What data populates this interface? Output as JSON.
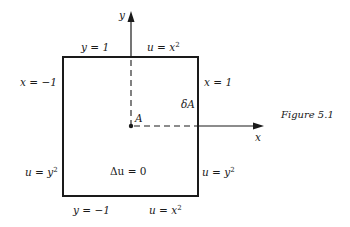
{
  "figure": {
    "caption": "Figure  5.1",
    "axes": {
      "x_label": "x",
      "y_label": "y"
    },
    "point_label": "A",
    "boundary_label": "δA",
    "equation": "Δu = 0",
    "labels": {
      "top_left": "y = 1",
      "top_right_base": "u = x",
      "top_right_exp": "2",
      "left_top": "x = −1",
      "right_top": "x = 1",
      "left_bottom_base": "u = y",
      "left_bottom_exp": "2",
      "right_bottom_base": "u = y",
      "right_bottom_exp": "2",
      "bottom_left": "y = −1",
      "bottom_right_base": "u = x",
      "bottom_right_exp": "2"
    },
    "colors": {
      "ink": "#1a1a1a",
      "background": "#ffffff"
    }
  }
}
